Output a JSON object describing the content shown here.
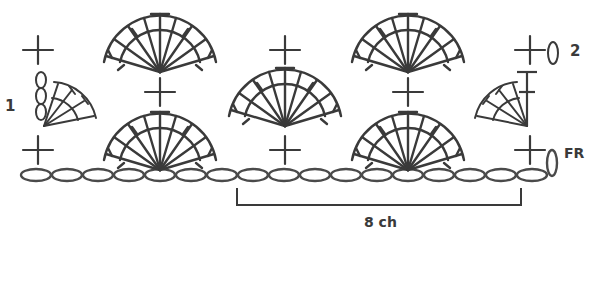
{
  "diagram": {
    "type": "crochet-stitch-chart",
    "foundation": {
      "label": "FR",
      "chain_count": 17
    },
    "row_labels": {
      "row1": "1",
      "row2": "2"
    },
    "repeat": {
      "label": "8 ch"
    },
    "stroke_color": "#3a3a3a",
    "background": "#ffffff",
    "stitches": {
      "single_crochet_bottom_x": [
        38,
        285,
        530
      ],
      "single_crochet_mid_x": [
        160,
        408
      ],
      "single_crochet_top_x": [
        38,
        285,
        530
      ],
      "row1_full_fans_x": [
        160,
        408
      ],
      "row2_center_fan_x": [
        284
      ],
      "row3_full_fans_x": [
        160,
        408
      ],
      "row2_half_fans": [
        "left",
        "right"
      ]
    }
  }
}
